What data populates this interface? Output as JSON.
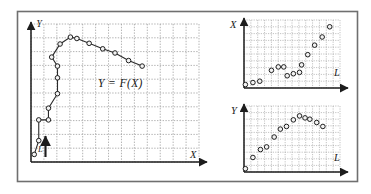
{
  "figure": {
    "name": "curve-and-component-plots",
    "background_color": "#ffffff",
    "frame_color": "#6f6f6f",
    "grid_color": "#9a9a9a",
    "axis_color": "#1d1d1d",
    "curve_color": "#2a2a2a",
    "marker_fill": "#f2f2f2",
    "marker_stroke": "#1f1f1f"
  },
  "chart_data": [
    {
      "id": "main-parametric-plot",
      "type": "line",
      "title": "",
      "annotation": "Y = F(X)",
      "xlabel": "X",
      "ylabel": "Y",
      "grid": true,
      "xlim": [
        0,
        13
      ],
      "ylim": [
        0,
        10
      ],
      "direction_arrow_label": "L",
      "x": [
        0.25,
        0.6,
        0.6,
        1.35,
        1.35,
        2.05,
        2.05,
        2.05,
        1.6,
        2.25,
        3.05,
        3.55,
        4.5,
        5.55,
        6.5,
        7.55,
        8.6
      ],
      "y": [
        0.55,
        1.55,
        3.05,
        3.05,
        3.9,
        4.95,
        6.1,
        6.95,
        7.6,
        8.55,
        9.05,
        8.95,
        8.6,
        8.2,
        7.9,
        7.35,
        6.95
      ],
      "values": [
        {
          "x": 0.25,
          "y": 0.55
        },
        {
          "x": 0.6,
          "y": 1.55
        },
        {
          "x": 0.6,
          "y": 3.05
        },
        {
          "x": 1.35,
          "y": 3.05
        },
        {
          "x": 1.35,
          "y": 3.9
        },
        {
          "x": 2.05,
          "y": 4.95
        },
        {
          "x": 2.05,
          "y": 6.1
        },
        {
          "x": 2.05,
          "y": 6.95
        },
        {
          "x": 1.6,
          "y": 7.6
        },
        {
          "x": 2.25,
          "y": 8.55
        },
        {
          "x": 3.05,
          "y": 9.05
        },
        {
          "x": 3.55,
          "y": 8.95
        },
        {
          "x": 4.5,
          "y": 8.6
        },
        {
          "x": 5.55,
          "y": 8.2
        },
        {
          "x": 6.5,
          "y": 7.9
        },
        {
          "x": 7.55,
          "y": 7.35
        },
        {
          "x": 8.6,
          "y": 6.95
        }
      ]
    },
    {
      "id": "x-vs-l-plot",
      "type": "scatter",
      "title": "",
      "xlabel": "L",
      "ylabel": "X",
      "grid": true,
      "xlim": [
        0,
        14
      ],
      "ylim": [
        0,
        10
      ],
      "values": [
        {
          "x": 0.2,
          "y": 0.5
        },
        {
          "x": 1.3,
          "y": 0.8
        },
        {
          "x": 2.3,
          "y": 1.0
        },
        {
          "x": 4.0,
          "y": 2.6
        },
        {
          "x": 5.0,
          "y": 3.1
        },
        {
          "x": 5.8,
          "y": 3.1
        },
        {
          "x": 6.3,
          "y": 1.8
        },
        {
          "x": 7.2,
          "y": 2.1
        },
        {
          "x": 8.1,
          "y": 2.3
        },
        {
          "x": 8.4,
          "y": 3.4
        },
        {
          "x": 9.3,
          "y": 4.9
        },
        {
          "x": 10.3,
          "y": 6.3
        },
        {
          "x": 11.4,
          "y": 7.5
        },
        {
          "x": 12.5,
          "y": 9.0
        }
      ]
    },
    {
      "id": "y-vs-l-plot",
      "type": "scatter",
      "title": "",
      "xlabel": "L",
      "ylabel": "Y",
      "grid": true,
      "xlim": [
        0,
        14
      ],
      "ylim": [
        0,
        10
      ],
      "values": [
        {
          "x": 0.2,
          "y": 0.5
        },
        {
          "x": 1.3,
          "y": 2.2
        },
        {
          "x": 2.4,
          "y": 3.4
        },
        {
          "x": 3.3,
          "y": 3.8
        },
        {
          "x": 4.4,
          "y": 5.3
        },
        {
          "x": 5.3,
          "y": 6.5
        },
        {
          "x": 6.2,
          "y": 6.9
        },
        {
          "x": 7.2,
          "y": 7.9
        },
        {
          "x": 8.1,
          "y": 8.5
        },
        {
          "x": 8.9,
          "y": 8.2
        },
        {
          "x": 9.6,
          "y": 8.0
        },
        {
          "x": 10.6,
          "y": 7.5
        },
        {
          "x": 11.5,
          "y": 6.9
        }
      ]
    }
  ],
  "labels": {
    "main_y_axis": "Y",
    "main_x_axis": "X",
    "main_equation": "Y = F(X)",
    "main_arrow": "L",
    "topright_y_axis": "X",
    "topright_x_axis": "L",
    "bottomright_y_axis": "Y",
    "bottomright_x_axis": "L"
  }
}
